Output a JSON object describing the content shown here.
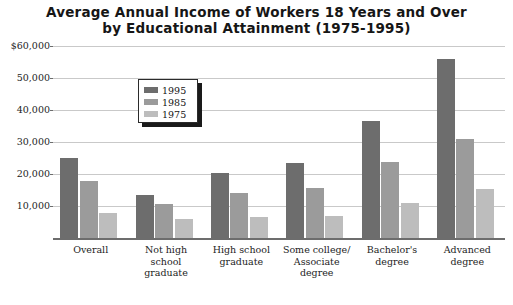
{
  "chart_data": {
    "type": "bar",
    "title": "Average Annual Income of Workers 18 Years and Over by Educational Attainment (1975-1995)",
    "title_line1": "Average Annual Income of Workers 18 Years and Over",
    "title_line2": "by Educational Attainment (1975-1995)",
    "xlabel": "",
    "ylabel": "",
    "ylim": [
      0,
      60000
    ],
    "grid": true,
    "legend_position": "upper-left-inside",
    "categories": [
      "Overall",
      "Not high school graduate",
      "High school graduate",
      "Some college/ Associate degree",
      "Bachelor's degree",
      "Advanced degree"
    ],
    "category_lines": [
      [
        "Overall"
      ],
      [
        "Not high",
        "school",
        "graduate"
      ],
      [
        "High school",
        "graduate"
      ],
      [
        "Some college/",
        "Associate",
        "degree"
      ],
      [
        "Bachelor's",
        "degree"
      ],
      [
        "Advanced",
        "degree"
      ]
    ],
    "ytick_labels": [
      "$60,000",
      "50,000",
      "40,000",
      "30,000",
      "20,000",
      "10,000"
    ],
    "ytick_values": [
      60000,
      50000,
      40000,
      30000,
      20000,
      10000
    ],
    "series": [
      {
        "name": "1995",
        "color": "#6d6d6d",
        "values": [
          25000,
          13400,
          20300,
          23500,
          36600,
          56000
        ]
      },
      {
        "name": "1985",
        "color": "#9b9b9b",
        "values": [
          17800,
          10600,
          14000,
          15600,
          23800,
          31000
        ]
      },
      {
        "name": "1975",
        "color": "#bdbdbd",
        "values": [
          7800,
          5900,
          6500,
          7000,
          11000,
          15300
        ]
      }
    ]
  },
  "legend": {
    "items": [
      {
        "label": "1995",
        "color": "#6d6d6d"
      },
      {
        "label": "1985",
        "color": "#9b9b9b"
      },
      {
        "label": "1975",
        "color": "#bdbdbd"
      }
    ]
  },
  "colors": {
    "background": "#ffffff",
    "gridline": "#c9c9c9",
    "axis": "#6d6d6d",
    "text": "#1d1d1d",
    "title": "#161616",
    "series_1995": "#6d6d6d",
    "series_1985": "#9b9b9b",
    "series_1975": "#bdbdbd"
  }
}
